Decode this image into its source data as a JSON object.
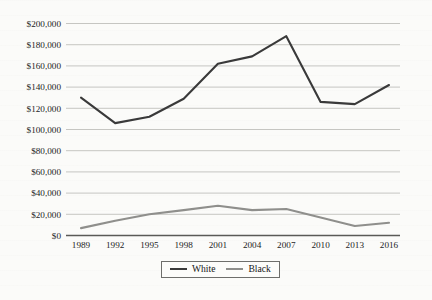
{
  "chart_data": {
    "type": "line",
    "title": "",
    "subtitle": "",
    "xlabel": "",
    "ylabel": "",
    "categories": [
      "1989",
      "1992",
      "1995",
      "1998",
      "2001",
      "2004",
      "2007",
      "2010",
      "2013",
      "2016"
    ],
    "series": [
      {
        "name": "White",
        "color": "#3a3a3a",
        "values": [
          130000,
          106000,
          112000,
          129000,
          162000,
          169000,
          188000,
          126000,
          124000,
          142000
        ]
      },
      {
        "name": "Black",
        "color": "#8f8f8c",
        "values": [
          7000,
          14000,
          20000,
          24000,
          28000,
          24000,
          25000,
          17000,
          9000,
          12000
        ]
      }
    ],
    "ylim": [
      0,
      200000
    ],
    "ytick_values": [
      0,
      20000,
      40000,
      60000,
      80000,
      100000,
      120000,
      140000,
      160000,
      180000,
      200000
    ],
    "ytick_labels": [
      "$0",
      "$20,000",
      "$40,000",
      "$60,000",
      "$80,000",
      "$100,000",
      "$120,000",
      "$140,000",
      "$160,000",
      "$180,000",
      "$200,000"
    ],
    "xtick_labels": [
      "1989",
      "1992",
      "1995",
      "1998",
      "2001",
      "2004",
      "2007",
      "2010",
      "2013",
      "2016"
    ],
    "grid": "horizontal",
    "legend_position": "bottom-center",
    "legend_entries": [
      "White",
      "Black"
    ],
    "annotations": []
  },
  "legend": {
    "white_label": "White",
    "black_label": "Black"
  }
}
